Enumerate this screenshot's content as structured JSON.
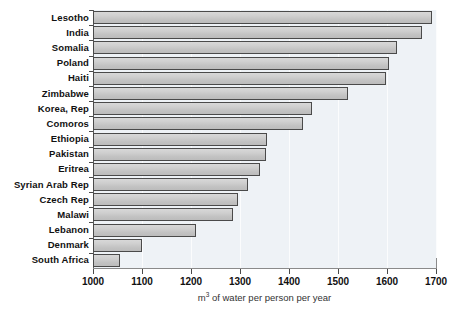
{
  "chart_data": {
    "type": "bar",
    "orientation": "horizontal",
    "title": "",
    "xlabel": "m³ of water per person per year",
    "ylabel": "",
    "xlim": [
      1000,
      1700
    ],
    "ylim": null,
    "grid": true,
    "legend": null,
    "xticks": [
      1000,
      1100,
      1200,
      1300,
      1400,
      1500,
      1600,
      1700
    ],
    "categories": [
      "Lesotho",
      "India",
      "Somalia",
      "Poland",
      "Haiti",
      "Zimbabwe",
      "Korea, Rep",
      "Comoros",
      "Ethiopia",
      "Pakistan",
      "Eritrea",
      "Syrian Arab Rep",
      "Czech Rep",
      "Malawi",
      "Lebanon",
      "Denmark",
      "South Africa"
    ],
    "values": [
      1692,
      1672,
      1621,
      1603,
      1598,
      1521,
      1447,
      1429,
      1354,
      1352,
      1340,
      1317,
      1295,
      1286,
      1210,
      1100,
      1055
    ],
    "bar_fill_color": "#c8c8c8",
    "bar_edge_color": "#4a4a4a",
    "plot_background_color": "#eef2f6",
    "gridline_color": "#fbfcfd",
    "axis_color": "#4a4a4a"
  },
  "axis": {
    "x_title": "m³ of water per person per year",
    "x_title_prefix": "m",
    "x_title_exponent": "3",
    "x_title_suffix": " of water per person per year"
  }
}
